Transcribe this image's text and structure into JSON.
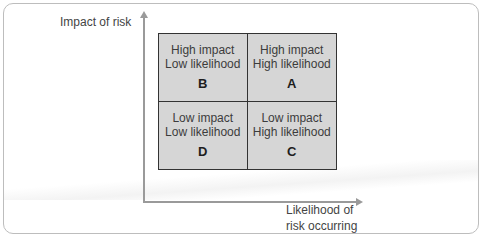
{
  "diagram": {
    "type": "risk-matrix",
    "y_axis_label": "Impact of risk",
    "x_axis_label_line1": "Likelihood of",
    "x_axis_label_line2": "risk occurring",
    "quadrants": {
      "top_left": {
        "line1": "High impact",
        "line2": "Low likelihood",
        "letter": "B"
      },
      "top_right": {
        "line1": "High impact",
        "line2": "High likelihood",
        "letter": "A"
      },
      "bottom_left": {
        "line1": "Low impact",
        "line2": "Low likelihood",
        "letter": "D"
      },
      "bottom_right": {
        "line1": "Low impact",
        "line2": "High likelihood",
        "letter": "C"
      }
    },
    "colors": {
      "quadrant_fill": "#d6d6d6",
      "grid_border": "#333333",
      "axis": "#9a9a9a"
    }
  }
}
